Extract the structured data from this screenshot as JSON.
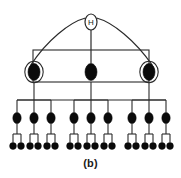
{
  "figure": {
    "caption": "(b)",
    "colors": {
      "stroke": "#2b2b2b",
      "fill_solid": "#0b0b0b",
      "background": "#ffffff",
      "outline_fill": "#ffffff"
    },
    "canvas": {
      "width": 181,
      "height": 178
    }
  },
  "nodes": {
    "root": {
      "label": "H",
      "name": "root-node-h",
      "style": "open-ellipse-with-letter",
      "cx": 91,
      "cy": 22,
      "rx": 6,
      "ry": 8
    },
    "level2": [
      {
        "label": "",
        "name": "level2-node-left",
        "style": "filled-ellipse-outlined",
        "cx": 34,
        "cy": 72,
        "rx": 6,
        "ry": 8.5
      },
      {
        "label": "",
        "name": "level2-node-center",
        "style": "filled-ellipse",
        "cx": 91,
        "cy": 72,
        "rx": 6,
        "ry": 8.5
      },
      {
        "label": "",
        "name": "level2-node-right",
        "style": "filled-ellipse-outlined",
        "cx": 149,
        "cy": 72,
        "rx": 6,
        "ry": 8.5
      }
    ],
    "level3": [
      {
        "name": "level3-node-1",
        "style": "filled-ellipse",
        "cx": 17,
        "cy": 118,
        "rx": 4.2,
        "ry": 5.6
      },
      {
        "name": "level3-node-2",
        "style": "filled-ellipse",
        "cx": 34,
        "cy": 118,
        "rx": 4.2,
        "ry": 5.6
      },
      {
        "name": "level3-node-3",
        "style": "filled-ellipse",
        "cx": 51,
        "cy": 118,
        "rx": 4.2,
        "ry": 5.6
      },
      {
        "name": "level3-node-4",
        "style": "filled-ellipse",
        "cx": 74,
        "cy": 118,
        "rx": 4.2,
        "ry": 5.6
      },
      {
        "name": "level3-node-5",
        "style": "filled-ellipse",
        "cx": 91,
        "cy": 118,
        "rx": 4.2,
        "ry": 5.6
      },
      {
        "name": "level3-node-6",
        "style": "filled-ellipse",
        "cx": 108,
        "cy": 118,
        "rx": 4.2,
        "ry": 5.6
      },
      {
        "name": "level3-node-7",
        "style": "filled-ellipse",
        "cx": 132,
        "cy": 118,
        "rx": 4.2,
        "ry": 5.6
      },
      {
        "name": "level3-node-8",
        "style": "filled-ellipse",
        "cx": 149,
        "cy": 118,
        "rx": 4.2,
        "ry": 5.6
      },
      {
        "name": "level3-node-9",
        "style": "filled-ellipse",
        "cx": 166,
        "cy": 118,
        "rx": 4.2,
        "ry": 5.6
      }
    ],
    "level4": [
      {
        "name": "leaf-node-1",
        "style": "filled-circle",
        "cx": 13,
        "cy": 146,
        "r": 3.4
      },
      {
        "name": "leaf-node-2",
        "style": "filled-circle",
        "cx": 21,
        "cy": 146,
        "r": 3.4
      },
      {
        "name": "leaf-node-3",
        "style": "filled-circle",
        "cx": 30,
        "cy": 146,
        "r": 3.4
      },
      {
        "name": "leaf-node-4",
        "style": "filled-circle",
        "cx": 38,
        "cy": 146,
        "r": 3.4
      },
      {
        "name": "leaf-node-5",
        "style": "filled-circle",
        "cx": 47,
        "cy": 146,
        "r": 3.4
      },
      {
        "name": "leaf-node-6",
        "style": "filled-circle",
        "cx": 55,
        "cy": 146,
        "r": 3.4
      },
      {
        "name": "leaf-node-7",
        "style": "filled-circle",
        "cx": 70,
        "cy": 146,
        "r": 3.4
      },
      {
        "name": "leaf-node-8",
        "style": "filled-circle",
        "cx": 78,
        "cy": 146,
        "r": 3.4
      },
      {
        "name": "leaf-node-9",
        "style": "filled-circle",
        "cx": 87,
        "cy": 146,
        "r": 3.4
      },
      {
        "name": "leaf-node-10",
        "style": "filled-circle",
        "cx": 95,
        "cy": 146,
        "r": 3.4
      },
      {
        "name": "leaf-node-11",
        "style": "filled-circle",
        "cx": 104,
        "cy": 146,
        "r": 3.4
      },
      {
        "name": "leaf-node-12",
        "style": "filled-circle",
        "cx": 112,
        "cy": 146,
        "r": 3.4
      },
      {
        "name": "leaf-node-13",
        "style": "filled-circle",
        "cx": 128,
        "cy": 146,
        "r": 3.4
      },
      {
        "name": "leaf-node-14",
        "style": "filled-circle",
        "cx": 136,
        "cy": 146,
        "r": 3.4
      },
      {
        "name": "leaf-node-15",
        "style": "filled-circle",
        "cx": 145,
        "cy": 146,
        "r": 3.4
      },
      {
        "name": "leaf-node-16",
        "style": "filled-circle",
        "cx": 153,
        "cy": 146,
        "r": 3.4
      },
      {
        "name": "leaf-node-17",
        "style": "filled-circle",
        "cx": 162,
        "cy": 146,
        "r": 3.4
      },
      {
        "name": "leaf-node-18",
        "style": "filled-circle",
        "cx": 170,
        "cy": 146,
        "r": 3.4
      }
    ]
  },
  "edges": {
    "root_stem": {
      "x1": 91,
      "y1": 30,
      "x2": 91,
      "y2": 63.5
    },
    "root_arcs": [
      {
        "name": "arc-root-to-left",
        "d": "M 85.4 18 C 70 22 47 40 30.5 65.5"
      },
      {
        "name": "arc-root-to-right",
        "d": "M 96.6 18 C 112 22 135 40 152.5 65.5"
      }
    ],
    "sibling_box": {
      "x": 33,
      "y": 50,
      "width": 116,
      "height": 32
    },
    "level2_to_level3_bus": {
      "x1": 17,
      "y1": 100,
      "x2": 166,
      "y2": 100
    },
    "level2_drops": [
      {
        "x": 34,
        "y1": 82,
        "y2": 100
      },
      {
        "x": 91,
        "y1": 82,
        "y2": 100
      },
      {
        "x": 149,
        "y1": 82,
        "y2": 100
      }
    ],
    "group_brackets": [
      {
        "name": "bracket-group-left",
        "x1": 17,
        "x2": 51,
        "y": 100
      },
      {
        "name": "bracket-group-center",
        "x1": 74,
        "x2": 108,
        "y": 100
      },
      {
        "name": "bracket-group-right",
        "x1": 132,
        "x2": 166,
        "y": 100
      }
    ],
    "level3_stems": [
      {
        "x": 17,
        "y1": 100,
        "y2": 112.4
      },
      {
        "x": 34,
        "y1": 100,
        "y2": 112.4
      },
      {
        "x": 51,
        "y1": 100,
        "y2": 112.4
      },
      {
        "x": 74,
        "y1": 100,
        "y2": 112.4
      },
      {
        "x": 91,
        "y1": 100,
        "y2": 112.4
      },
      {
        "x": 108,
        "y1": 100,
        "y2": 112.4
      },
      {
        "x": 132,
        "y1": 100,
        "y2": 112.4
      },
      {
        "x": 149,
        "y1": 100,
        "y2": 112.4
      },
      {
        "x": 166,
        "y1": 100,
        "y2": 112.4
      }
    ],
    "leaf_forks": [
      {
        "name": "fork-1",
        "cx": 17,
        "top": 123.6,
        "bar": 134,
        "left": 13,
        "right": 21,
        "bottom": 142.6
      },
      {
        "name": "fork-2",
        "cx": 34,
        "top": 123.6,
        "bar": 134,
        "left": 30,
        "right": 38,
        "bottom": 142.6
      },
      {
        "name": "fork-3",
        "cx": 51,
        "top": 123.6,
        "bar": 134,
        "left": 47,
        "right": 55,
        "bottom": 142.6
      },
      {
        "name": "fork-4",
        "cx": 74,
        "top": 123.6,
        "bar": 134,
        "left": 70,
        "right": 78,
        "bottom": 142.6
      },
      {
        "name": "fork-5",
        "cx": 91,
        "top": 123.6,
        "bar": 134,
        "left": 87,
        "right": 95,
        "bottom": 142.6
      },
      {
        "name": "fork-6",
        "cx": 108,
        "top": 123.6,
        "bar": 134,
        "left": 104,
        "right": 112,
        "bottom": 142.6
      },
      {
        "name": "fork-7",
        "cx": 132,
        "top": 123.6,
        "bar": 134,
        "left": 128,
        "right": 136,
        "bottom": 142.6
      },
      {
        "name": "fork-8",
        "cx": 149,
        "top": 123.6,
        "bar": 134,
        "left": 145,
        "right": 153,
        "bottom": 142.6
      },
      {
        "name": "fork-9",
        "cx": 166,
        "top": 123.6,
        "bar": 134,
        "left": 162,
        "right": 170,
        "bottom": 142.6
      }
    ]
  }
}
